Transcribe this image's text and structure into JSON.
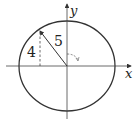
{
  "diagram": {
    "type": "unit-circle-style coordinate diagram",
    "axes": {
      "x_label": "x",
      "y_label": "y"
    },
    "labels": {
      "vertical_leg": "4",
      "hypotenuse": "5"
    },
    "colors": {
      "stroke": "#333333",
      "background": "#ffffff"
    }
  }
}
